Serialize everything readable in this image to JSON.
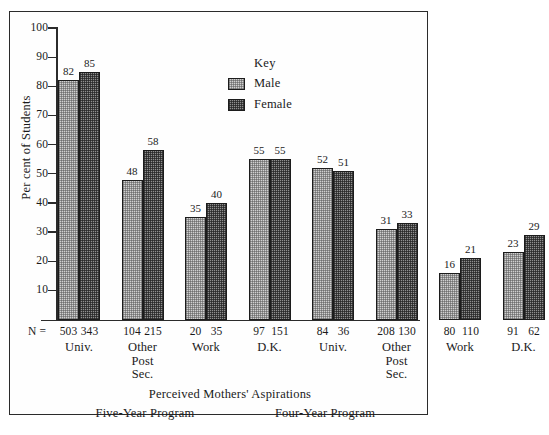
{
  "chart_data": {
    "type": "bar",
    "title": "",
    "xlabel": "Perceived Mothers' Aspirations",
    "ylabel": "Per cent of Students",
    "ylim": [
      0,
      100
    ],
    "yticks": [
      10,
      20,
      30,
      40,
      50,
      60,
      70,
      80,
      90,
      100
    ],
    "grid": false,
    "legend": {
      "title": "Key",
      "position": "upper center",
      "entries": [
        "Male",
        "Female"
      ]
    },
    "categories": [
      "Univ.",
      "Other Post Sec.",
      "Work",
      "D.K.",
      "Univ.",
      "Other Post Sec.",
      "Work",
      "D.K."
    ],
    "category_lines": [
      [
        "Univ."
      ],
      [
        "Other",
        "Post",
        "Sec."
      ],
      [
        "Work"
      ],
      [
        "D.K."
      ],
      [
        "Univ."
      ],
      [
        "Other",
        "Post",
        "Sec."
      ],
      [
        "Work"
      ],
      [
        "D.K."
      ]
    ],
    "series": [
      {
        "name": "Male",
        "values": [
          82,
          48,
          35,
          55,
          52,
          31,
          16,
          23
        ]
      },
      {
        "name": "Female",
        "values": [
          85,
          58,
          40,
          55,
          51,
          33,
          21,
          29
        ]
      }
    ],
    "n_prefix": "N =",
    "n_counts": [
      {
        "male": "503",
        "female": "343"
      },
      {
        "male": "104",
        "female": "215"
      },
      {
        "male": "20",
        "female": "35"
      },
      {
        "male": "97",
        "female": "151"
      },
      {
        "male": "84",
        "female": "36"
      },
      {
        "male": "208",
        "female": "130"
      },
      {
        "male": "80",
        "female": "110"
      },
      {
        "male": "91",
        "female": "62"
      }
    ],
    "group_annotations": [
      {
        "label": "Five-Year Program",
        "categories": [
          0,
          1,
          2,
          3
        ]
      },
      {
        "label": "Four-Year Program",
        "categories": [
          4,
          5,
          6,
          7
        ]
      }
    ],
    "colors": {
      "male_fill": "#d0d0d0",
      "female_fill": "#8f8f8f",
      "outline": "#1c1c1c",
      "text": "#1a1a1a"
    }
  }
}
